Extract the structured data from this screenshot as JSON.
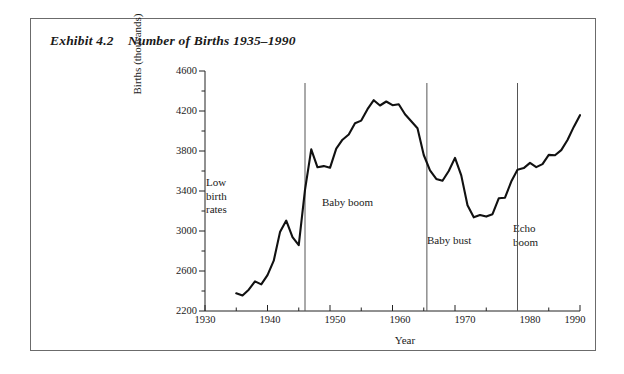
{
  "exhibit": {
    "title": "Exhibit 4.2    Number of Births 1935–1990"
  },
  "chart_data": {
    "type": "line",
    "title": "Number of Births 1935–1990",
    "xlabel": "Year",
    "ylabel": "Births (thousands)",
    "xlim": [
      1930,
      1990
    ],
    "ylim": [
      2200,
      4600
    ],
    "x_major_ticks": [
      1930,
      1940,
      1950,
      1960,
      1970,
      1980,
      1990
    ],
    "x_minor_tick_step": 5,
    "y_major_ticks": [
      2200,
      2600,
      3000,
      3400,
      3800,
      4200,
      4600
    ],
    "y_minor_tick_step": 200,
    "grid": false,
    "legend": "none",
    "line_color": "#111111",
    "series": [
      {
        "name": "Births (thousands)",
        "x": [
          1935,
          1936,
          1937,
          1938,
          1939,
          1940,
          1941,
          1942,
          1943,
          1944,
          1945,
          1946,
          1947,
          1948,
          1949,
          1950,
          1951,
          1952,
          1953,
          1954,
          1955,
          1956,
          1957,
          1958,
          1959,
          1960,
          1961,
          1962,
          1963,
          1964,
          1965,
          1966,
          1967,
          1968,
          1969,
          1970,
          1971,
          1972,
          1973,
          1974,
          1975,
          1976,
          1977,
          1978,
          1979,
          1980,
          1981,
          1982,
          1983,
          1984,
          1985,
          1986,
          1987,
          1988,
          1989,
          1990
        ],
        "values": [
          2377,
          2355,
          2413,
          2496,
          2466,
          2559,
          2703,
          2989,
          3104,
          2939,
          2858,
          3411,
          3817,
          3637,
          3649,
          3632,
          3823,
          3913,
          3965,
          4078,
          4104,
          4218,
          4308,
          4255,
          4295,
          4258,
          4268,
          4167,
          4098,
          4027,
          3760,
          3606,
          3521,
          3502,
          3600,
          3731,
          3556,
          3258,
          3137,
          3160,
          3144,
          3168,
          3327,
          3333,
          3494,
          3612,
          3629,
          3681,
          3639,
          3669,
          3761,
          3757,
          3809,
          3910,
          4041,
          4158
        ]
      }
    ],
    "dividers": [
      {
        "x": 1946,
        "label": "period-divider-1946"
      },
      {
        "x": 1965.5,
        "label": "period-divider-1965"
      },
      {
        "x": 1980,
        "label": "period-divider-1980"
      }
    ],
    "annotations": [
      {
        "id": "low-birth-rates",
        "text": "Low\nbirth\nrates",
        "x": 1937.5,
        "y": 3400
      },
      {
        "id": "baby-boom",
        "text": "Baby boom",
        "x": 1954,
        "y": 3200
      },
      {
        "id": "baby-bust",
        "text": "Baby bust",
        "x": 1972,
        "y": 2820
      },
      {
        "id": "echo-boom",
        "text": "Echo\nboom",
        "x": 1984,
        "y": 2960
      }
    ]
  },
  "axes": {
    "y_tick_labels": [
      "4600",
      "4200",
      "3800",
      "3400",
      "3000",
      "2600",
      "2200"
    ],
    "x_tick_labels": [
      "1930",
      "1940",
      "1950",
      "1960",
      "1970",
      "1980",
      "1990"
    ]
  }
}
